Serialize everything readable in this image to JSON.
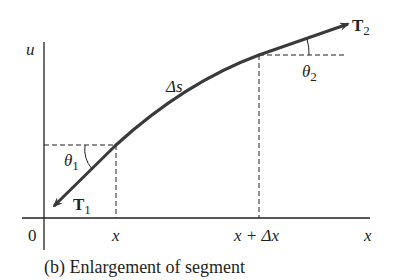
{
  "figure": {
    "caption": "(b) Enlargement of segment",
    "axes": {
      "y_label": "u",
      "x_label": "x",
      "origin_label": "0"
    },
    "ticks": {
      "x1": "x",
      "x2": "x + Δx"
    },
    "curve": {
      "label": "Δs"
    },
    "vectors": {
      "T1": {
        "main": "T",
        "sub": "1"
      },
      "T2": {
        "main": "T",
        "sub": "2"
      }
    },
    "angles": {
      "theta1": {
        "main": "θ",
        "sub": "1"
      },
      "theta2": {
        "main": "θ",
        "sub": "2"
      }
    },
    "colors": {
      "ink": "#231f20",
      "curve": "#3a3a3a",
      "background": "#ffffff"
    }
  }
}
